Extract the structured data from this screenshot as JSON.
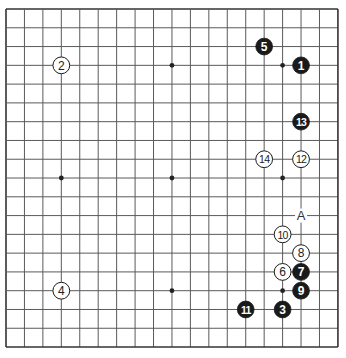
{
  "board": {
    "size": 19,
    "origin_x": 6,
    "origin_y": 9,
    "step_x": 18.44,
    "step_y": 18.78,
    "line_color": "#5a5a5a",
    "border_color": "#333333",
    "background": "#ffffff",
    "star_points": [
      [
        3,
        3
      ],
      [
        9,
        3
      ],
      [
        15,
        3
      ],
      [
        3,
        9
      ],
      [
        9,
        9
      ],
      [
        15,
        9
      ],
      [
        3,
        15
      ],
      [
        9,
        15
      ],
      [
        15,
        15
      ]
    ]
  },
  "stones": [
    {
      "move": "1",
      "color": "black",
      "col": 16,
      "row": 3
    },
    {
      "move": "2",
      "color": "white",
      "col": 3,
      "row": 3
    },
    {
      "move": "3",
      "color": "black",
      "col": 15,
      "row": 16
    },
    {
      "move": "4",
      "color": "white",
      "col": 3,
      "row": 15
    },
    {
      "move": "5",
      "color": "black",
      "col": 14,
      "row": 2
    },
    {
      "move": "6",
      "color": "white",
      "col": 15,
      "row": 14
    },
    {
      "move": "7",
      "color": "black",
      "col": 16,
      "row": 14
    },
    {
      "move": "8",
      "color": "white",
      "col": 16,
      "row": 13
    },
    {
      "move": "9",
      "color": "black",
      "col": 16,
      "row": 15
    },
    {
      "move": "10",
      "color": "white",
      "col": 15,
      "row": 12
    },
    {
      "move": "11",
      "color": "black",
      "col": 13,
      "row": 16
    },
    {
      "move": "12",
      "color": "white",
      "col": 16,
      "row": 8
    },
    {
      "move": "13",
      "color": "black",
      "col": 16,
      "row": 6
    },
    {
      "move": "14",
      "color": "white",
      "col": 14,
      "row": 8
    }
  ],
  "labels": [
    {
      "text": "A",
      "col": 16,
      "row": 11
    }
  ]
}
